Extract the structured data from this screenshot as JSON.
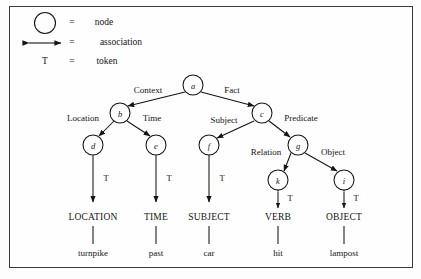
{
  "figure": {
    "ink_color": "#141414",
    "border_color": "#3a3a3a"
  },
  "legend": {
    "items": [
      {
        "symbol": "circle",
        "icon_name": "node-circle-icon",
        "equals": "=",
        "label": "node"
      },
      {
        "symbol": "double-arrow",
        "icon_name": "association-arrow-icon",
        "equals": "=",
        "label": "association"
      },
      {
        "symbol": "T",
        "icon_name": "token-letter-icon",
        "equals": "=",
        "label": "token"
      }
    ]
  },
  "graph": {
    "nodes": [
      {
        "id": "a",
        "label": "a",
        "x": 193,
        "y": 85,
        "r": 10
      },
      {
        "id": "b",
        "label": "b",
        "x": 120,
        "y": 113,
        "r": 10
      },
      {
        "id": "c",
        "label": "c",
        "x": 262,
        "y": 113,
        "r": 10
      },
      {
        "id": "d",
        "label": "d",
        "x": 93,
        "y": 145,
        "r": 10
      },
      {
        "id": "e",
        "label": "e",
        "x": 156,
        "y": 145,
        "r": 10
      },
      {
        "id": "f",
        "label": "f",
        "x": 209,
        "y": 145,
        "r": 10
      },
      {
        "id": "g",
        "label": "g",
        "x": 298,
        "y": 145,
        "r": 10
      },
      {
        "id": "k",
        "label": "k",
        "x": 278,
        "y": 180,
        "r": 10
      },
      {
        "id": "i",
        "label": "i",
        "x": 344,
        "y": 180,
        "r": 10
      }
    ],
    "edges": [
      {
        "from": "a",
        "to": "b",
        "label": "Context",
        "label_x": 148,
        "label_y": 90
      },
      {
        "from": "a",
        "to": "c",
        "label": "Fact",
        "label_x": 232,
        "label_y": 90
      },
      {
        "from": "b",
        "to": "d",
        "label": "Location",
        "label_x": 83,
        "label_y": 118
      },
      {
        "from": "b",
        "to": "e",
        "label": "Time",
        "label_x": 152,
        "label_y": 118
      },
      {
        "from": "c",
        "to": "f",
        "label": "Subject",
        "label_x": 224,
        "label_y": 120
      },
      {
        "from": "c",
        "to": "g",
        "label": "Predicate",
        "label_x": 301,
        "label_y": 118
      },
      {
        "from": "g",
        "to": "k",
        "label": "Relation",
        "label_x": 266,
        "label_y": 152
      },
      {
        "from": "g",
        "to": "i",
        "label": "Object",
        "label_x": 333,
        "label_y": 152
      }
    ],
    "tokens": [
      {
        "node": "d",
        "term": "LOCATION",
        "word": "turnpike",
        "token_label": "T",
        "x": 93,
        "arrow_top": 156,
        "arrow_bottom": 202,
        "token_x": 106,
        "token_y": 178
      },
      {
        "node": "e",
        "term": "TIME",
        "word": "past",
        "token_label": "T",
        "x": 156,
        "arrow_top": 156,
        "arrow_bottom": 202,
        "token_x": 169,
        "token_y": 178
      },
      {
        "node": "f",
        "term": "SUBJECT",
        "word": "car",
        "token_label": "T",
        "x": 209,
        "arrow_top": 156,
        "arrow_bottom": 202,
        "token_x": 222,
        "token_y": 178
      },
      {
        "node": "k",
        "term": "VERB",
        "word": "hit",
        "token_label": "T",
        "x": 278,
        "arrow_top": 191,
        "arrow_bottom": 208,
        "token_x": 290,
        "token_y": 198
      },
      {
        "node": "i",
        "term": "OBJECT",
        "word": "lampost",
        "token_label": "T",
        "x": 344,
        "arrow_top": 191,
        "arrow_bottom": 208,
        "token_x": 356,
        "token_y": 198
      }
    ],
    "terminal_row_y": 218,
    "word_row_y": 253,
    "stem_top_y": 226,
    "stem_bottom_y": 244
  }
}
